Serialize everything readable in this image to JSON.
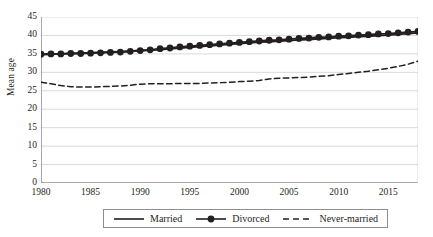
{
  "chart_data": {
    "type": "line",
    "title": "",
    "xlabel": "",
    "ylabel": "Mean age",
    "xlim": [
      1980,
      2018
    ],
    "ylim": [
      0,
      45
    ],
    "ytick_values": [
      0,
      5,
      10,
      15,
      20,
      25,
      30,
      35,
      40,
      45
    ],
    "ytick_labels": [
      "0",
      "5",
      "10",
      "15",
      "20",
      "25",
      "30",
      "35",
      "40",
      "45"
    ],
    "xtick_values": [
      1980,
      1985,
      1990,
      1995,
      2000,
      2005,
      2010,
      2015
    ],
    "xtick_labels": [
      "1980",
      "1985",
      "1990",
      "1995",
      "2000",
      "2005",
      "2010",
      "2015"
    ],
    "grid": "horizontal",
    "legend_position": "bottom-center",
    "x": [
      1980,
      1981,
      1982,
      1983,
      1984,
      1985,
      1986,
      1987,
      1988,
      1989,
      1990,
      1991,
      1992,
      1993,
      1994,
      1995,
      1996,
      1997,
      1998,
      1999,
      2000,
      2001,
      2002,
      2003,
      2004,
      2005,
      2006,
      2007,
      2008,
      2009,
      2010,
      2011,
      2012,
      2013,
      2014,
      2015,
      2016,
      2017,
      2018
    ],
    "series": [
      {
        "name": "Married",
        "style": "solid",
        "marker": "none",
        "color": "#231f20",
        "values": [
          34.8,
          34.9,
          35.0,
          35.1,
          35.2,
          35.3,
          35.4,
          35.5,
          35.6,
          35.7,
          35.9,
          36.0,
          36.2,
          36.4,
          36.6,
          36.8,
          37.0,
          37.2,
          37.4,
          37.6,
          37.8,
          38.0,
          38.2,
          38.3,
          38.5,
          38.6,
          38.8,
          38.9,
          39.1,
          39.2,
          39.4,
          39.5,
          39.7,
          39.8,
          40.0,
          40.1,
          40.3,
          40.5,
          40.7
        ]
      },
      {
        "name": "Divorced",
        "style": "solid",
        "marker": "circle",
        "color": "#231f20",
        "values": [
          34.9,
          35.0,
          35.0,
          35.1,
          35.1,
          35.2,
          35.3,
          35.4,
          35.5,
          35.7,
          35.9,
          36.1,
          36.4,
          36.6,
          36.9,
          37.1,
          37.3,
          37.5,
          37.7,
          37.9,
          38.1,
          38.3,
          38.5,
          38.7,
          38.8,
          39.0,
          39.2,
          39.3,
          39.5,
          39.6,
          39.8,
          39.9,
          40.1,
          40.2,
          40.4,
          40.5,
          40.7,
          40.9,
          41.1
        ]
      },
      {
        "name": "Never-married",
        "style": "dashed",
        "marker": "none",
        "color": "#231f20",
        "values": [
          27.3,
          26.9,
          26.4,
          26.1,
          26.0,
          26.0,
          26.1,
          26.2,
          26.3,
          26.5,
          26.8,
          26.9,
          26.9,
          26.9,
          27.0,
          27.0,
          27.0,
          27.1,
          27.2,
          27.3,
          27.5,
          27.6,
          27.8,
          28.2,
          28.4,
          28.5,
          28.6,
          28.7,
          28.9,
          29.1,
          29.4,
          29.7,
          30.0,
          30.3,
          30.7,
          31.1,
          31.6,
          32.2,
          33.0
        ]
      }
    ]
  },
  "legend": {
    "items": [
      {
        "label": "Married",
        "symbol": "solid-line"
      },
      {
        "label": "Divorced",
        "symbol": "solid-line-circle-marker"
      },
      {
        "label": "Never-married",
        "symbol": "dashed-line"
      }
    ]
  }
}
